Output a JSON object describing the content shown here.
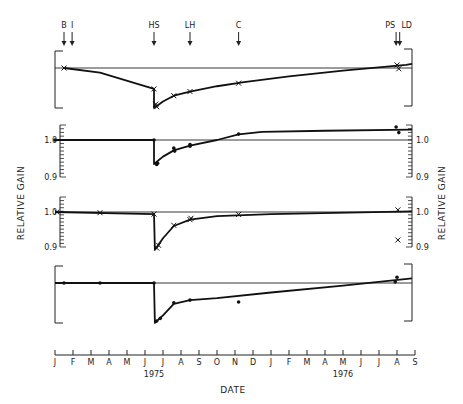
{
  "chart_data": {
    "type": "line",
    "title": "",
    "xlabel": "DATE",
    "ylabel": "RELATIVE GAIN",
    "x_ticks": [
      "J",
      "F",
      "M",
      "A",
      "M",
      "J",
      "J",
      "A",
      "S",
      "O",
      "N",
      "D",
      "J",
      "F",
      "M",
      "A",
      "M",
      "J",
      "J",
      "A",
      "S"
    ],
    "year_labels": [
      {
        "label": "1975",
        "tick_index": 5.5
      },
      {
        "label": "1976",
        "tick_index": 16
      }
    ],
    "event_markers": [
      {
        "label": "B",
        "month_index": 0.5
      },
      {
        "label": "I",
        "month_index": 0.95
      },
      {
        "label": "HS",
        "month_index": 5.5
      },
      {
        "label": "LH",
        "month_index": 7.5
      },
      {
        "label": "C",
        "month_index": 10.2
      },
      {
        "label": "PS",
        "month_index": 18.95
      },
      {
        "label": "LD",
        "month_index": 19.15
      }
    ],
    "panels": [
      {
        "name": "panel-1",
        "marker": "x",
        "y_ticks": [],
        "ylim": [
          0.88,
          1.03
        ],
        "reference": 1.0,
        "points": [
          {
            "m": 0.5,
            "v": 1.0
          },
          {
            "m": 5.5,
            "v": 0.945
          },
          {
            "m": 5.6,
            "v": 0.905
          },
          {
            "m": 5.65,
            "v": 0.898
          },
          {
            "m": 6.6,
            "v": 0.927
          },
          {
            "m": 7.5,
            "v": 0.938
          },
          {
            "m": 10.2,
            "v": 0.96
          },
          {
            "m": 19.0,
            "v": 1.008
          },
          {
            "m": 19.1,
            "v": 0.998
          }
        ],
        "curve": [
          [
            0.5,
            1.0
          ],
          [
            2.5,
            0.988
          ],
          [
            5.5,
            0.945
          ],
          [
            5.5,
            0.895
          ],
          [
            6.0,
            0.912
          ],
          [
            6.6,
            0.927
          ],
          [
            7.5,
            0.938
          ],
          [
            9.0,
            0.952
          ],
          [
            10.5,
            0.963
          ],
          [
            13,
            0.978
          ],
          [
            16,
            0.993
          ],
          [
            19.5,
            1.008
          ],
          [
            20,
            1.011
          ]
        ]
      },
      {
        "name": "panel-2",
        "marker": "dot",
        "y_ticks": [
          {
            "label": "1.0",
            "v": 1.0
          },
          {
            "label": "0.9",
            "v": 0.9
          }
        ],
        "ylim": [
          0.9,
          1.05
        ],
        "reference": 1.0,
        "points": [
          {
            "m": 0.0,
            "v": 1.0
          },
          {
            "m": 5.5,
            "v": 1.0
          },
          {
            "m": 5.65,
            "v": 0.934
          },
          {
            "m": 5.7,
            "v": 0.937
          },
          {
            "m": 6.6,
            "v": 0.978
          },
          {
            "m": 6.65,
            "v": 0.97
          },
          {
            "m": 7.5,
            "v": 0.988
          },
          {
            "m": 7.5,
            "v": 0.983
          },
          {
            "m": 10.2,
            "v": 1.016
          },
          {
            "m": 18.95,
            "v": 1.035
          },
          {
            "m": 19.1,
            "v": 1.02
          }
        ],
        "curve": [
          [
            0.0,
            1.0
          ],
          [
            5.5,
            1.0
          ],
          [
            5.5,
            0.935
          ],
          [
            6.0,
            0.955
          ],
          [
            6.6,
            0.972
          ],
          [
            7.5,
            0.985
          ],
          [
            9.0,
            1.0
          ],
          [
            10.2,
            1.015
          ],
          [
            11.5,
            1.022
          ],
          [
            15,
            1.025
          ],
          [
            20,
            1.028
          ]
        ]
      },
      {
        "name": "panel-3",
        "marker": "x",
        "y_ticks": [
          {
            "label": "1.0",
            "v": 1.0
          },
          {
            "label": "0.9",
            "v": 0.9
          }
        ],
        "ylim": [
          0.9,
          1.03
        ],
        "reference": 1.0,
        "points": [
          {
            "m": 0.1,
            "v": 1.0
          },
          {
            "m": 2.5,
            "v": 0.998
          },
          {
            "m": 5.5,
            "v": 0.994
          },
          {
            "m": 5.65,
            "v": 0.897
          },
          {
            "m": 5.75,
            "v": 0.905
          },
          {
            "m": 6.6,
            "v": 0.962
          },
          {
            "m": 7.5,
            "v": 0.978
          },
          {
            "m": 7.55,
            "v": 0.982
          },
          {
            "m": 10.2,
            "v": 0.993
          },
          {
            "m": 19.05,
            "v": 1.006
          },
          {
            "m": 19.05,
            "v": 0.92
          }
        ],
        "curve": [
          [
            0.0,
            1.0
          ],
          [
            5.5,
            0.994
          ],
          [
            5.55,
            0.892
          ],
          [
            6.0,
            0.925
          ],
          [
            6.6,
            0.96
          ],
          [
            7.5,
            0.978
          ],
          [
            9.0,
            0.988
          ],
          [
            12,
            0.994
          ],
          [
            20,
            1.002
          ]
        ]
      },
      {
        "name": "panel-4",
        "marker": "dot",
        "y_ticks": [],
        "ylim": [
          0.88,
          1.03
        ],
        "reference": 1.0,
        "points": [
          {
            "m": 0.5,
            "v": 1.0
          },
          {
            "m": 2.5,
            "v": 1.0
          },
          {
            "m": 5.5,
            "v": 1.0
          },
          {
            "m": 5.65,
            "v": 0.9
          },
          {
            "m": 5.85,
            "v": 0.907
          },
          {
            "m": 6.6,
            "v": 0.948
          },
          {
            "m": 7.5,
            "v": 0.955
          },
          {
            "m": 10.2,
            "v": 0.95
          },
          {
            "m": 19.0,
            "v": 1.015
          },
          {
            "m": 18.9,
            "v": 1.003
          }
        ],
        "curve": [
          [
            0.0,
            1.0
          ],
          [
            5.5,
            1.0
          ],
          [
            5.55,
            0.895
          ],
          [
            6.0,
            0.915
          ],
          [
            6.6,
            0.945
          ],
          [
            7.5,
            0.955
          ],
          [
            9.0,
            0.96
          ],
          [
            12,
            0.975
          ],
          [
            16,
            0.993
          ],
          [
            20,
            1.012
          ]
        ]
      }
    ],
    "grid": false,
    "legend": null
  }
}
